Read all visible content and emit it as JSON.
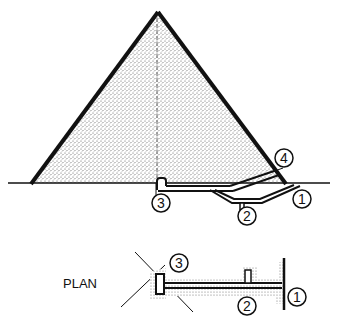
{
  "diagram": {
    "elevation": {
      "callouts": [
        {
          "id": "1",
          "label": "1"
        },
        {
          "id": "2",
          "label": "2"
        },
        {
          "id": "3",
          "label": "3"
        },
        {
          "id": "4",
          "label": "4"
        }
      ]
    },
    "plan": {
      "title": "PLAN",
      "callouts": [
        {
          "id": "1",
          "label": "1"
        },
        {
          "id": "2",
          "label": "2"
        },
        {
          "id": "3",
          "label": "3"
        }
      ]
    },
    "colors": {
      "ink": "#111111",
      "stipple_dot": "#555555",
      "background": "#ffffff"
    }
  }
}
